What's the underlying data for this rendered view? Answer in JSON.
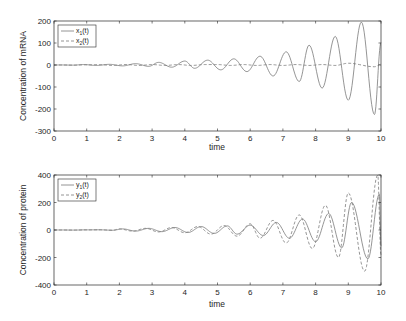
{
  "chart_data": [
    {
      "type": "line",
      "title": "",
      "xlabel": "time",
      "ylabel": "Concentration of mRNA",
      "xlim": [
        0,
        10
      ],
      "ylim": [
        -300,
        200
      ],
      "xticks": [
        "0",
        "1",
        "2",
        "3",
        "4",
        "5",
        "6",
        "7",
        "8",
        "9",
        "10"
      ],
      "yticks": [
        "200",
        "100",
        "0",
        "-100",
        "-200",
        "-300"
      ],
      "grid": false,
      "legend_position": "upper left",
      "series": [
        {
          "name": "x1(t)",
          "style": "solid",
          "description": "Growing oscillation, period ~0.78",
          "peaks": [
            [
              0.9,
              2
            ],
            [
              1.7,
              3
            ],
            [
              2.5,
              6
            ],
            [
              3.2,
              12
            ],
            [
              4.0,
              18
            ],
            [
              4.7,
              22
            ],
            [
              5.5,
              28
            ],
            [
              6.3,
              40
            ],
            [
              7.1,
              60
            ],
            [
              7.8,
              90
            ],
            [
              8.6,
              130
            ],
            [
              9.4,
              195
            ]
          ],
          "troughs": [
            [
              1.3,
              -2
            ],
            [
              2.1,
              -4
            ],
            [
              2.9,
              -6
            ],
            [
              3.6,
              -10
            ],
            [
              4.3,
              -15
            ],
            [
              5.1,
              -22
            ],
            [
              5.9,
              -30
            ],
            [
              6.7,
              -50
            ],
            [
              7.5,
              -75
            ],
            [
              8.2,
              -105
            ],
            [
              9.0,
              -160
            ],
            [
              9.8,
              -225
            ]
          ]
        },
        {
          "name": "x2(t)",
          "style": "dashed",
          "description": "Near zero throughout, slight growth",
          "peaks": [
            [
              9.0,
              8
            ]
          ],
          "troughs": [
            [
              9.8,
              -8
            ]
          ]
        }
      ]
    },
    {
      "type": "line",
      "title": "",
      "xlabel": "time",
      "ylabel": "Concentration of protein",
      "xlim": [
        0,
        10
      ],
      "ylim": [
        -400,
        400
      ],
      "xticks": [
        "0",
        "1",
        "2",
        "3",
        "4",
        "5",
        "6",
        "7",
        "8",
        "9",
        "10"
      ],
      "yticks": [
        "400",
        "200",
        "0",
        "-200",
        "-400"
      ],
      "grid": false,
      "legend_position": "upper left",
      "series": [
        {
          "name": "y1(t)",
          "style": "solid",
          "description": "Growing oscillation",
          "peaks": [
            [
              2.1,
              8
            ],
            [
              2.9,
              12
            ],
            [
              3.7,
              18
            ],
            [
              4.5,
              25
            ],
            [
              5.3,
              30
            ],
            [
              6.0,
              35
            ],
            [
              6.8,
              55
            ],
            [
              7.6,
              80
            ],
            [
              8.4,
              120
            ],
            [
              9.1,
              200
            ],
            [
              9.95,
              260
            ]
          ],
          "troughs": [
            [
              2.5,
              -8
            ],
            [
              3.3,
              -12
            ],
            [
              4.1,
              -18
            ],
            [
              4.9,
              -25
            ],
            [
              5.6,
              -30
            ],
            [
              6.4,
              -40
            ],
            [
              7.2,
              -60
            ],
            [
              8.0,
              -85
            ],
            [
              8.8,
              -130
            ],
            [
              9.6,
              -210
            ]
          ]
        },
        {
          "name": "y2(t)",
          "style": "dashed",
          "description": "Growing oscillation, larger amplitude, slight phase lead",
          "peaks": [
            [
              2.0,
              8
            ],
            [
              2.8,
              12
            ],
            [
              3.6,
              18
            ],
            [
              4.4,
              25
            ],
            [
              5.2,
              32
            ],
            [
              6.0,
              45
            ],
            [
              6.7,
              70
            ],
            [
              7.5,
              110
            ],
            [
              8.3,
              180
            ],
            [
              9.0,
              270
            ],
            [
              9.9,
              400
            ]
          ],
          "troughs": [
            [
              2.4,
              -8
            ],
            [
              3.2,
              -14
            ],
            [
              4.0,
              -20
            ],
            [
              4.8,
              -30
            ],
            [
              5.6,
              -45
            ],
            [
              6.3,
              -60
            ],
            [
              7.1,
              -95
            ],
            [
              7.9,
              -135
            ],
            [
              8.7,
              -200
            ],
            [
              9.5,
              -300
            ]
          ]
        }
      ]
    }
  ],
  "plots": {
    "top": {
      "ylabel": "Concentration of mRNA",
      "xlabel": "time",
      "legend": [
        {
          "base": "x",
          "sub": "1",
          "tail": "(t)"
        },
        {
          "base": "x",
          "sub": "2",
          "tail": "(t)"
        }
      ],
      "yticks": [
        "200",
        "100",
        "0",
        "-100",
        "-200",
        "-300"
      ],
      "xticks": [
        "0",
        "1",
        "2",
        "3",
        "4",
        "5",
        "6",
        "7",
        "8",
        "9",
        "10"
      ]
    },
    "bottom": {
      "ylabel": "Concentration of protein",
      "xlabel": "time",
      "legend": [
        {
          "base": "y",
          "sub": "1",
          "tail": "(t)"
        },
        {
          "base": "y",
          "sub": "2",
          "tail": "(t)"
        }
      ],
      "yticks": [
        "400",
        "200",
        "0",
        "-200",
        "-400"
      ],
      "xticks": [
        "0",
        "1",
        "2",
        "3",
        "4",
        "5",
        "6",
        "7",
        "8",
        "9",
        "10"
      ]
    }
  },
  "colors": {
    "line": "#7a7a7a",
    "axis": "#262626",
    "background": "#ffffff"
  }
}
